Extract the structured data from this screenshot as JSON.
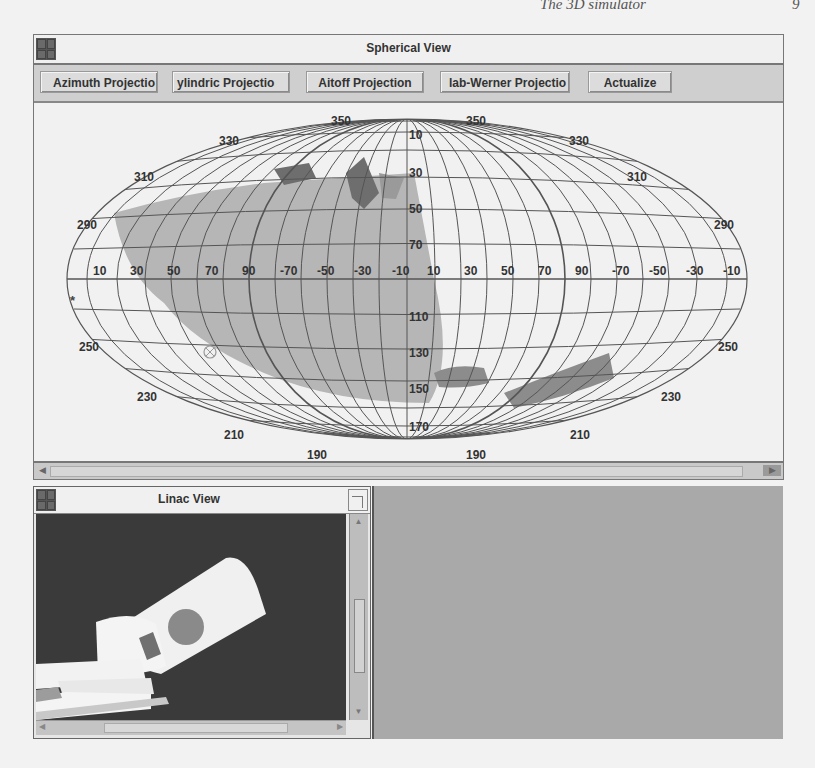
{
  "page_header": {
    "text": "The 3D simulator",
    "page_number": "9"
  },
  "spherical_view": {
    "title": "Spherical View",
    "buttons": [
      {
        "label": "Azimuth Projection",
        "visible_label": "Azimuth Projectio"
      },
      {
        "label": "Cylindric Projection",
        "visible_label": "ylindric Projectio"
      },
      {
        "label": "Aitoff Projection",
        "visible_label": "Aitoff Projection"
      },
      {
        "label": "Hammer-Werner Projection",
        "visible_label": "lab-Werner Projectio"
      },
      {
        "label": "Actualize",
        "visible_label": "Actualize"
      }
    ],
    "active_projection": "Aitoff Projection",
    "meridian_labels_top": [
      "330",
      "350",
      "350",
      "330"
    ],
    "meridian_labels_left": [
      "310",
      "290",
      "250",
      "230",
      "210",
      "190"
    ],
    "meridian_labels_right": [
      "310",
      "290",
      "250",
      "230",
      "210",
      "190"
    ],
    "center_column_labels": [
      "10",
      "30",
      "50",
      "70",
      "110",
      "130",
      "150",
      "170"
    ],
    "equator_labels": [
      "10",
      "30",
      "50",
      "70",
      "90",
      "-70",
      "-50",
      "-30",
      "-10",
      "10",
      "30",
      "50",
      "70",
      "90",
      "-70",
      "-50",
      "-30",
      "-10"
    ],
    "markers": [
      {
        "name": "star-marker",
        "glyph": "*"
      },
      {
        "name": "crosshair-marker",
        "glyph": "⊗"
      }
    ],
    "colors": {
      "grid": "#555555",
      "shaded_region": "#b3b3b3",
      "dark_region": "#6e6e6e",
      "background": "#f1f1f1"
    }
  },
  "linac_view": {
    "title": "Linac View",
    "background": "#3a3a3a"
  }
}
